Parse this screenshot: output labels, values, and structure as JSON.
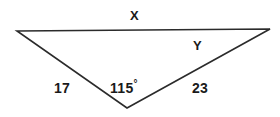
{
  "figure": {
    "type": "triangle-diagram",
    "background_color": "#ffffff",
    "stroke_color": "#2b2b2b",
    "text_color": "#1a1a1a",
    "width": 280,
    "height": 117,
    "vertices": {
      "left": {
        "x": 17,
        "y": 31
      },
      "right": {
        "x": 270,
        "y": 29
      },
      "apex": {
        "x": 127,
        "y": 108
      }
    },
    "labels": {
      "side_top": "X",
      "angle_upper_right": "Y",
      "side_left": "17",
      "angle_apex_value": "115",
      "angle_apex_degree": "°",
      "side_right": "23"
    }
  },
  "chart_data": {
    "type": "diagram",
    "title": "",
    "shape": "triangle",
    "vertices": [
      {
        "name": "A",
        "x": 17,
        "y": 31,
        "role": "top-left"
      },
      {
        "name": "B",
        "x": 270,
        "y": 29,
        "role": "top-right"
      },
      {
        "name": "C",
        "x": 127,
        "y": 108,
        "role": "bottom-apex"
      }
    ],
    "edges": [
      {
        "from": "A",
        "to": "B",
        "label": "X",
        "known": false
      },
      {
        "from": "A",
        "to": "C",
        "label": "17",
        "value": 17,
        "known": true
      },
      {
        "from": "C",
        "to": "B",
        "label": "23",
        "value": 23,
        "known": true
      }
    ],
    "angles": [
      {
        "at": "C",
        "label": "115°",
        "value": 115,
        "unit": "degrees",
        "known": true
      },
      {
        "at": "B",
        "label": "Y",
        "known": false
      }
    ],
    "annotations": [
      "X",
      "Y",
      "17",
      "115°",
      "23"
    ]
  }
}
